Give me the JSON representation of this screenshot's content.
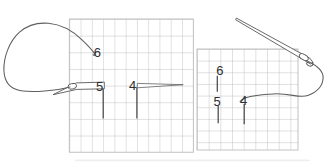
{
  "diagram": {
    "labels": {
      "left": [
        "6",
        "5",
        "4"
      ],
      "right": [
        "6",
        "5",
        "4"
      ]
    },
    "colors": {
      "background": "#ffffff",
      "grid": "#b3b3b3",
      "thread": "#5f5f5f",
      "needle_outline": "#585858",
      "label_text": "#2d2d2d",
      "stitch_mark": "#4a4a4a"
    }
  }
}
